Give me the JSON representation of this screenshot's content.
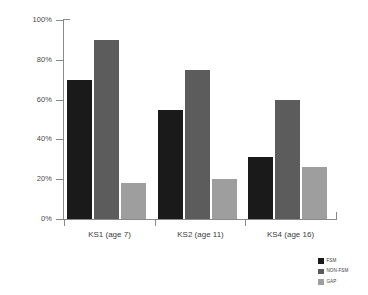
{
  "chart_data": {
    "type": "bar",
    "title": "",
    "subtitle": "",
    "xlabel": "",
    "ylabel": "",
    "ylim": [
      0,
      100
    ],
    "grid": false,
    "legend_position": "bottom-right",
    "y_ticks": [
      "0%",
      "20%",
      "40%",
      "60%",
      "80%",
      "100%"
    ],
    "y_tick_values": [
      0,
      20,
      40,
      60,
      80,
      100
    ],
    "categories": [
      "KS1 (age 7)",
      "KS2 (age 11)",
      "KS4 (age 16)"
    ],
    "series": [
      {
        "name": "FSM",
        "color": "#1a1a1a",
        "values": [
          70,
          55,
          31
        ]
      },
      {
        "name": "NON-FSM",
        "color": "#5c5c5c",
        "values": [
          90,
          75,
          60
        ]
      },
      {
        "name": "GAP",
        "color": "#9e9e9e",
        "values": [
          18,
          20,
          26
        ]
      }
    ]
  },
  "legend": {
    "entries": [
      {
        "label": "FSM"
      },
      {
        "label": "NON-FSM"
      },
      {
        "label": "GAP"
      }
    ]
  }
}
